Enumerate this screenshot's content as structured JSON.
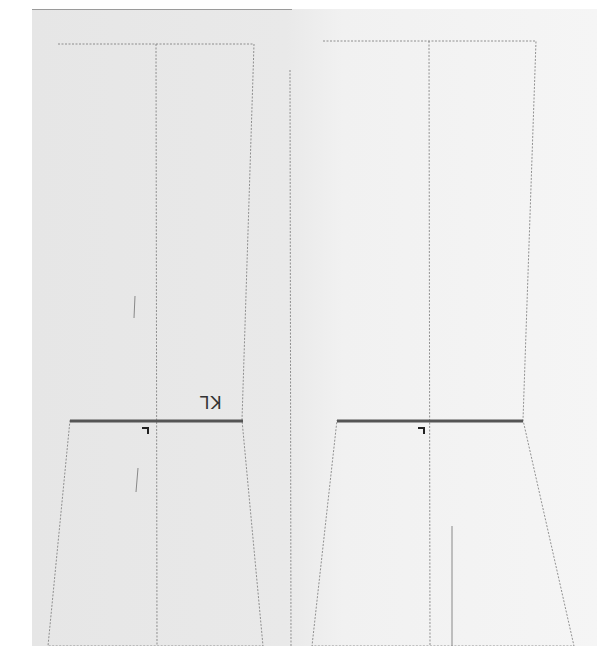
{
  "diagram": {
    "type": "sewing-pattern",
    "paper": {
      "color_left": "#e6e6e6",
      "color_right": "#f5f5f5"
    },
    "colors": {
      "dashed_line": "#777777",
      "knee_line": "#555555",
      "mark": "#222222"
    },
    "pieces": [
      {
        "name": "front-leg-piece",
        "outline": "58,44 254,44 242,420 263,646 48,646 70,420",
        "center_line": {
          "x1": 156,
          "y1": 44,
          "x2": 157,
          "y2": 646
        },
        "knee_line": {
          "x1": 70,
          "y1": 421,
          "x2": 243,
          "y2": 421
        },
        "knee_label": "KL",
        "knee_mark": {
          "x": 142,
          "y": 428
        },
        "grain_strokes": [
          {
            "x1": 135,
            "y1": 296,
            "x2": 134,
            "y2": 318
          },
          {
            "x1": 138,
            "y1": 468,
            "x2": 136,
            "y2": 492
          }
        ]
      },
      {
        "name": "back-leg-piece",
        "outline": "323,41 536,41 523,420 574,646 312,646 337,420",
        "center_line": {
          "x1": 429,
          "y1": 41,
          "x2": 430,
          "y2": 646
        },
        "knee_line": {
          "x1": 337,
          "y1": 421,
          "x2": 523,
          "y2": 421
        },
        "knee_mark": {
          "x": 418,
          "y": 428
        },
        "grain_strokes": [
          {
            "x1": 452,
            "y1": 526,
            "x2": 452,
            "y2": 646
          }
        ]
      }
    ],
    "separator_line": {
      "x1": 290,
      "y1": 70,
      "x2": 291,
      "y2": 646
    }
  }
}
